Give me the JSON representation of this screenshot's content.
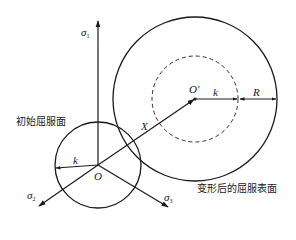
{
  "diagram": {
    "type": "yield-surface-hardening",
    "labels": {
      "sigma1": "σ",
      "sigma1_sub": "1",
      "sigma2": "σ",
      "sigma2_sub": "2",
      "sigma3": "σ",
      "sigma3_sub": "3",
      "origin": "O",
      "origin_prime": "O'",
      "k_small": "k",
      "k_dashed": "k",
      "R": "R",
      "X": "X",
      "initial_yield_surface": "初始屈服面",
      "deformed_yield_surface": "变形后的屈服表面"
    },
    "colors": {
      "stroke": "#1a1a1a",
      "background": "#ffffff"
    },
    "geometry": {
      "origin": [
        98,
        165
      ],
      "origin_prime": [
        195,
        99
      ],
      "initial_circle_radius": 43,
      "dashed_circle_radius": 43,
      "outer_circle_radius": 82
    }
  }
}
